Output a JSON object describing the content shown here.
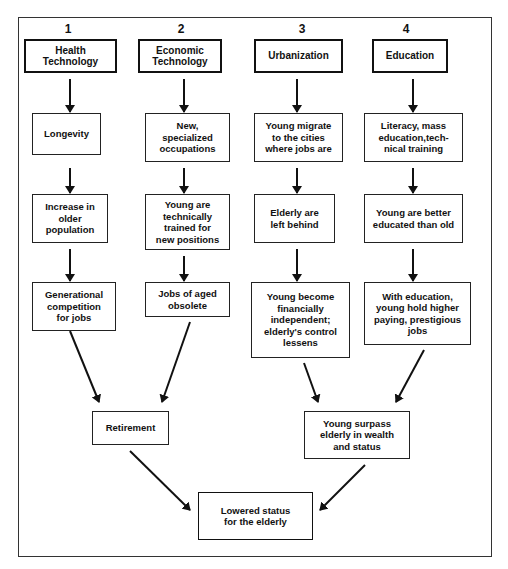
{
  "diagram": {
    "columns": [
      {
        "number": "1",
        "header": "Health\nTechnology",
        "steps": [
          "Longevity",
          "Increase in\nolder\npopulation",
          "Generational\ncompetition\nfor jobs"
        ]
      },
      {
        "number": "2",
        "header": "Economic\nTechnology",
        "steps": [
          "New,\nspecialized\noccupations",
          "Young are\ntechnically\ntrained for\nnew positions",
          "Jobs of aged\nobsolete"
        ]
      },
      {
        "number": "3",
        "header": "Urbanization",
        "steps": [
          "Young migrate\nto the cities\nwhere jobs are",
          "Elderly are\nleft behind",
          "Young become\nfinancially\nindependent;\nelderly's control\nlessens"
        ]
      },
      {
        "number": "4",
        "header": "Education",
        "steps": [
          "Literacy, mass\neducation,tech-\nnical training",
          "Young are better\neducated than old",
          "With education,\nyoung hold higher\npaying, prestigious\njobs"
        ]
      }
    ],
    "merge_left": "Retirement",
    "merge_right": "Young surpass\nelderly in wealth\nand status",
    "outcome": "Lowered status\nfor the elderly"
  }
}
